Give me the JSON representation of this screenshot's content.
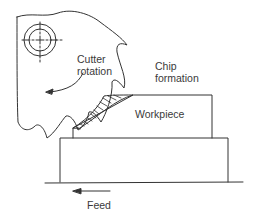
{
  "figure": {
    "labels": {
      "cutter_rotation_line1": "Cutter",
      "cutter_rotation_line2": "rotation",
      "chip_formation_line1": "Chip",
      "chip_formation_line2": "formation",
      "workpiece": "Workpiece",
      "feed": "Feed"
    },
    "colors": {
      "line": "#333333",
      "text": "#3a3a3a",
      "background": "#ffffff"
    }
  }
}
